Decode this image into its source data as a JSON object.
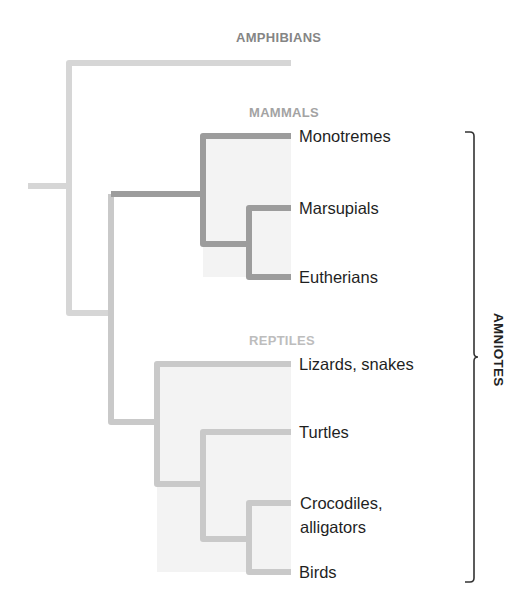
{
  "diagram": {
    "type": "phylogenetic-tree",
    "group_labels": {
      "amphibians": "AMPHIBIANS",
      "mammals": "MAMMALS",
      "reptiles": "REPTILES"
    },
    "taxa": [
      {
        "id": "monotremes",
        "label": "Monotremes",
        "group": "mammals"
      },
      {
        "id": "marsupials",
        "label": "Marsupials",
        "group": "mammals"
      },
      {
        "id": "eutherians",
        "label": "Eutherians",
        "group": "mammals"
      },
      {
        "id": "lizards",
        "label": "Lizards, snakes",
        "group": "reptiles"
      },
      {
        "id": "turtles",
        "label": "Turtles",
        "group": "reptiles"
      },
      {
        "id": "crocodiles_line1",
        "label": "Crocodiles,",
        "group": "reptiles"
      },
      {
        "id": "crocodiles_line2",
        "label": "alligators",
        "group": "reptiles"
      },
      {
        "id": "birds",
        "label": "Birds",
        "group": "reptiles"
      }
    ],
    "bracket_label": "AMNIOTES",
    "colors": {
      "root_branch": "#d6d6d6",
      "mammal_branch": "#9c9c9c",
      "reptile_branch": "#c9c9c9",
      "clade_shade": "#f3f3f3",
      "amphibians_label": "#858585",
      "mammals_label": "#a3a3a3",
      "reptiles_label": "#bdbdbd",
      "bracket": "#333333"
    }
  }
}
